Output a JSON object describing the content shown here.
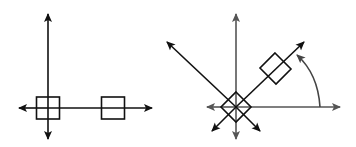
{
  "diagram": {
    "colors": {
      "primary_stroke": "#111111",
      "axis_gray": "#555555",
      "arc": "#444444",
      "background": "#ffffff"
    },
    "left_figure": {
      "axes": [
        "vertical-axis",
        "horizontal-axis"
      ],
      "boxes": [
        "square-at-origin",
        "square-on-x-axis"
      ],
      "arrow_directions": [
        "up",
        "down",
        "left",
        "right"
      ]
    },
    "right_figure": {
      "axes": [
        "vertical-axis",
        "horizontal-axis",
        "diagonal-nw-axis",
        "diagonal-ne-axis"
      ],
      "boxes": [
        "rotated-square-at-origin",
        "rotated-square-on-diagonal"
      ],
      "rotation_indicator": "counterclockwise-arc-45-degrees",
      "arrow_directions": [
        "up",
        "down",
        "left",
        "right",
        "north-west",
        "north-east",
        "south-west",
        "south-east"
      ]
    }
  }
}
